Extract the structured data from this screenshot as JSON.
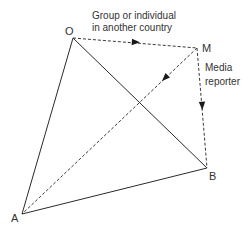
{
  "diagram": {
    "points": {
      "O": {
        "label": "O",
        "x": 73,
        "y": 38
      },
      "M": {
        "label": "M",
        "x": 197,
        "y": 48
      },
      "B": {
        "label": "B",
        "x": 207,
        "y": 168
      },
      "A": {
        "label": "A",
        "x": 22,
        "y": 214
      }
    },
    "annotations": {
      "group_line1": "Group or individual",
      "group_line2": "in another country",
      "media_line1": "Media",
      "media_line2": "reporter"
    },
    "edges": [
      {
        "from": "O",
        "to": "A",
        "style": "solid"
      },
      {
        "from": "O",
        "to": "B",
        "style": "solid"
      },
      {
        "from": "A",
        "to": "B",
        "style": "solid"
      },
      {
        "from": "O",
        "to": "M",
        "style": "dashed",
        "arrow": true
      },
      {
        "from": "M",
        "to": "A",
        "style": "dashed",
        "arrow": true
      },
      {
        "from": "M",
        "to": "B",
        "style": "dashed",
        "arrow": true
      }
    ]
  }
}
